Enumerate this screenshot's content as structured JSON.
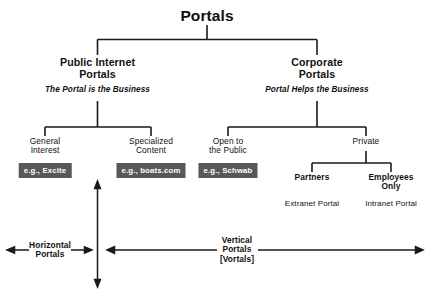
{
  "diagram": {
    "title": "Portals",
    "type": "tree-taxonomy",
    "colors": {
      "background": "#ffffff",
      "line": "#1a1a1a",
      "text": "#111111",
      "badge_bg": "#585858",
      "badge_text": "#ffffff"
    },
    "root": {
      "label": "Portals"
    },
    "level1": [
      {
        "id": "public-internet-portals",
        "line1": "Public Internet",
        "line2": "Portals",
        "subtitle": "The Portal is the Business"
      },
      {
        "id": "corporate-portals",
        "line1": "Corporate",
        "line2": "Portals",
        "subtitle": "Portal Helps the Business"
      }
    ],
    "level2": [
      {
        "id": "general-interest",
        "line1": "General",
        "line2": "Interest",
        "badge": "e.g., Excite"
      },
      {
        "id": "specialized-content",
        "line1": "Specialized",
        "line2": "Content",
        "badge": "e.g., boats.com"
      },
      {
        "id": "open-to-the-public",
        "line1": "Open to",
        "line2": "the Public",
        "badge": "e.g., Schwab"
      },
      {
        "id": "private",
        "line1": "Private",
        "line2": "",
        "badge": ""
      }
    ],
    "level3": [
      {
        "id": "partners",
        "line1": "Partners",
        "line2": "",
        "caption": "Extranet Portal"
      },
      {
        "id": "employees-only",
        "line1": "Employees",
        "line2": "Only",
        "caption": "Intranet Portal"
      }
    ],
    "axis": {
      "horizontal_axis_label_line1": "Horizontal",
      "horizontal_axis_label_line2": "Portals",
      "vertical_axis_label_line1": "Vertical",
      "vertical_axis_label_line2": "Portals",
      "vertical_axis_label_line3": "[Vortals]"
    }
  }
}
